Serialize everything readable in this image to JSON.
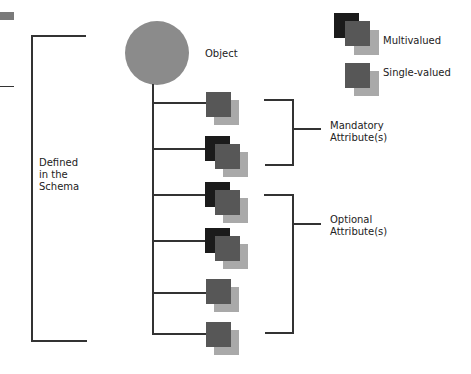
{
  "diagram": {
    "object_label": "Object",
    "schema_label": "Defined\nin the\nSchema",
    "mandatory_label": "Mandatory\nAttribute(s)",
    "optional_label": "Optional\nAttribute(s)"
  },
  "legend": {
    "multivalued_label": "Multivalued",
    "single_valued_label": "Single-valued"
  },
  "attributes": [
    {
      "group": "mandatory",
      "type": "single-valued"
    },
    {
      "group": "mandatory",
      "type": "multivalued"
    },
    {
      "group": "optional",
      "type": "multivalued"
    },
    {
      "group": "optional",
      "type": "multivalued"
    },
    {
      "group": "optional",
      "type": "single-valued"
    },
    {
      "group": "optional",
      "type": "single-valued"
    }
  ],
  "colors": {
    "object": "#8b8b8b",
    "front": "#1b1b1b",
    "middle": "#575757",
    "back": "#a9a9a9",
    "line": "#333333"
  }
}
